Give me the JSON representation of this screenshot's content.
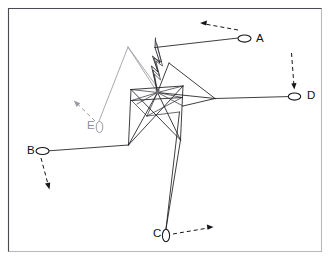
{
  "figure": {
    "background_color": "#ffffff",
    "frame_color": "#4a4a50",
    "edge_color": "#1c1c20",
    "gray_color": "#9a9aa2",
    "width": 330,
    "height": 260
  },
  "frame": {
    "x": 8,
    "y": 8,
    "width": 313,
    "height": 243
  },
  "hub": {
    "name": "central-hub",
    "x": 157.5,
    "y": 92.5
  },
  "nodes": [
    {
      "id": "A",
      "label": "A",
      "cx": 244.5,
      "cy": 38.5,
      "rx": 6.5,
      "ry": 3.6,
      "label_x": 256,
      "label_y": 38.5,
      "color": "#15151a",
      "arrow": {
        "direction": "left",
        "from_x": 238,
        "from_y": 30,
        "to_x": 200,
        "to_y": 23,
        "head_angle": 186
      }
    },
    {
      "id": "B",
      "label": "B",
      "cx": 42.5,
      "cy": 151.0,
      "rx": 6.5,
      "ry": 3.6,
      "label_x": 27,
      "label_y": 150.5,
      "color": "#15151a",
      "arrow": {
        "direction": "down-right",
        "from_x": 41,
        "from_y": 158,
        "to_x": 50,
        "to_y": 189,
        "head_angle": 74
      }
    },
    {
      "id": "C",
      "label": "C",
      "cx": 166.0,
      "cy": 235.5,
      "rx": 3.6,
      "ry": 6.2,
      "label_x": 153,
      "label_y": 233.5,
      "color": "#15151a",
      "arrow": {
        "direction": "right",
        "from_x": 173,
        "from_y": 234,
        "to_x": 213,
        "to_y": 227,
        "head_angle": -10
      }
    },
    {
      "id": "D",
      "label": "D",
      "cx": 294.5,
      "cy": 96.5,
      "rx": 6.2,
      "ry": 3.6,
      "label_x": 307,
      "label_y": 96.0,
      "color": "#15151a",
      "arrow": {
        "direction": "down",
        "from_x": 292,
        "from_y": 53,
        "to_x": 294,
        "to_y": 89,
        "head_angle": 86
      }
    },
    {
      "id": "E",
      "label": "E",
      "cx": 99.5,
      "cy": 127.0,
      "rx": 3.3,
      "ry": 5.6,
      "label_x": 87,
      "label_y": 126.0,
      "color": "#9a9aa2",
      "arrow": {
        "direction": "up-left",
        "from_x": 95,
        "from_y": 121,
        "to_x": 74,
        "to_y": 101,
        "head_angle": 223
      }
    }
  ],
  "paths": {
    "a_path": "M 238.2 38.0 L 155.0 47.5",
    "a_stub": "M 155.0 47.5 L 155.5 38.0",
    "b_path": "M 49.0 150.8 L 128.5 145.0",
    "c_path": "M 166.0 229.0 L 179.5 112.0",
    "d_path": "M 288.3 96.6 L 215.0 98.5",
    "e_path_gray": "M 99.0 121.2 L 128.0 47.0",
    "e_hub_gray": "M 128.0 47.0 L 157.5 92.5",
    "e_hub_gray2": "M 128.0 47.0 L 160.0 91.0",
    "fan_d1": "M 215.0 98.5 L 157.5 92.5",
    "fan_d2": "M 215.0 98.5 L 169.0 63.0",
    "fan_d3": "M 169.0 63.0 L 157.5 92.5",
    "fan_d4": "M 215.0 98.5 L 183.0 106.0",
    "zig1": "M 155.0 47.5 L 160.0 63.0 L 152.5 56.0 L 158.0 72.0 L 151.5 66.0 L 157.5 92.5",
    "zig2": "M 155.5 40.0 L 161.5 62.0 L 154.0 58.0 L 159.5 76.0 L 153.0 70.0 L 157.5 92.5",
    "zig3": "M 156.8 44.0 L 162.5 66.0 L 155.8 61.0 L 160.5 80.0 L 154.4 74.0 L 157.5 92.5",
    "box_top": "M 131.0 89.5 L 183.0 86.0",
    "box_left": "M 131.0 89.5 L 128.5 145.0",
    "box_right": "M 183.0 86.0 L 180.5 140.0",
    "box_mid": "M 131.5 100.5 L 182.0 97.5",
    "tri_a": "M 131.0 89.5 L 157.5 92.5",
    "tri_b": "M 183.0 86.0 L 157.5 92.5",
    "tri_c": "M 157.5 92.5 L 147.0 116.0",
    "tri_d": "M 131.5 100.5 L 147.0 116.0",
    "tri_e": "M 182.0 97.5 L 147.0 116.0",
    "cross_1": "M 131.0 89.5 L 180.5 140.0",
    "cross_2": "M 183.0 86.0 L 128.5 145.0",
    "cross_3": "M 128.5 145.0 L 157.5 92.5",
    "cross_4": "M 180.5 140.0 L 157.5 92.5",
    "cross_5": "M 147.0 116.0 L 179.5 112.0",
    "tail_c": "M 180.5 140.0 L 166.0 229.0",
    "spur_1": "M 157.5 92.5 L 131.5 100.5",
    "spur_2": "M 157.5 92.5 L 182.0 97.5",
    "spur_3": "M 157.5 92.5 L 183.0 106.0",
    "spur_4": "M 157.5 92.5 L 137.0 104.0"
  },
  "legend": {
    "node_count": 5,
    "labels": [
      "A",
      "B",
      "C",
      "D",
      "E"
    ]
  }
}
